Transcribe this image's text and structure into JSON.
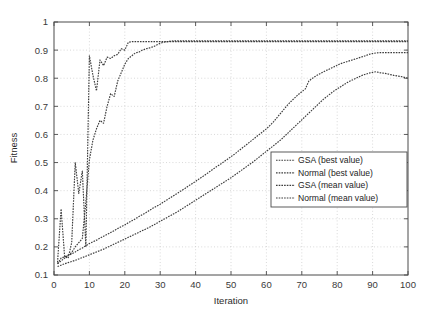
{
  "chart_data": {
    "type": "line",
    "title": "",
    "xlabel": "Iteration",
    "ylabel": "Fitness",
    "xlim": [
      0,
      100
    ],
    "ylim": [
      0.1,
      1
    ],
    "xticks": [
      0,
      10,
      20,
      30,
      40,
      50,
      60,
      70,
      80,
      90,
      100
    ],
    "xtick_labels": [
      "0",
      "10",
      "20",
      "30",
      "40",
      "50",
      "60",
      "70",
      "80",
      "90",
      "100"
    ],
    "yticks": [
      0.1,
      0.2,
      0.3,
      0.4,
      0.5,
      0.6,
      0.7,
      0.8,
      0.9,
      1
    ],
    "ytick_labels": [
      "0.1",
      "0.2",
      "0.3",
      "0.4",
      "0.5",
      "0.6",
      "0.7",
      "0.8",
      "0.9",
      "1"
    ],
    "grid": true,
    "grid_color": "#c8c8c8",
    "legend_position": "center-right",
    "line_color": "#3c3c3c",
    "x": [
      1,
      2,
      3,
      4,
      5,
      6,
      7,
      8,
      9,
      10,
      11,
      12,
      13,
      14,
      15,
      16,
      17,
      18,
      19,
      20,
      21,
      22,
      23,
      24,
      25,
      26,
      27,
      28,
      29,
      30,
      31,
      32,
      33,
      34,
      35,
      36,
      37,
      38,
      39,
      40,
      41,
      42,
      43,
      44,
      45,
      46,
      47,
      48,
      49,
      50,
      51,
      52,
      53,
      54,
      55,
      56,
      57,
      58,
      59,
      60,
      61,
      62,
      63,
      64,
      65,
      66,
      67,
      68,
      69,
      70,
      71,
      72,
      73,
      74,
      75,
      76,
      77,
      78,
      79,
      80,
      81,
      82,
      83,
      84,
      85,
      86,
      87,
      88,
      89,
      90,
      91,
      92,
      93,
      94,
      95,
      96,
      97,
      98,
      99,
      100
    ],
    "series": [
      {
        "name": "GSA (best value)",
        "style": "dotted",
        "values": [
          0.145,
          0.335,
          0.165,
          0.16,
          0.215,
          0.5,
          0.39,
          0.47,
          0.2,
          0.88,
          0.81,
          0.755,
          0.865,
          0.845,
          0.875,
          0.87,
          0.88,
          0.885,
          0.905,
          0.9,
          0.928,
          0.93,
          0.93,
          0.93,
          0.93,
          0.93,
          0.93,
          0.93,
          0.93,
          0.93,
          0.93,
          0.93,
          0.93,
          0.93,
          0.93,
          0.93,
          0.93,
          0.93,
          0.93,
          0.93,
          0.93,
          0.93,
          0.93,
          0.93,
          0.93,
          0.93,
          0.93,
          0.93,
          0.93,
          0.93,
          0.93,
          0.93,
          0.93,
          0.93,
          0.93,
          0.93,
          0.93,
          0.93,
          0.93,
          0.93,
          0.93,
          0.93,
          0.93,
          0.93,
          0.93,
          0.93,
          0.93,
          0.93,
          0.93,
          0.93,
          0.93,
          0.93,
          0.93,
          0.93,
          0.93,
          0.93,
          0.93,
          0.93,
          0.93,
          0.93,
          0.93,
          0.93,
          0.93,
          0.93,
          0.93,
          0.93,
          0.93,
          0.93,
          0.93,
          0.93,
          0.93,
          0.93,
          0.93,
          0.93,
          0.93,
          0.93,
          0.93,
          0.93,
          0.93,
          0.93
        ]
      },
      {
        "name": "Normal (best value)",
        "style": "dotted",
        "values": [
          0.14,
          0.15,
          0.16,
          0.17,
          0.18,
          0.2,
          0.215,
          0.23,
          0.36,
          0.51,
          0.58,
          0.62,
          0.65,
          0.64,
          0.7,
          0.745,
          0.735,
          0.79,
          0.82,
          0.85,
          0.87,
          0.88,
          0.89,
          0.893,
          0.9,
          0.905,
          0.908,
          0.912,
          0.918,
          0.924,
          0.928,
          0.93,
          0.932,
          0.933,
          0.933,
          0.933,
          0.933,
          0.933,
          0.933,
          0.933,
          0.933,
          0.933,
          0.933,
          0.933,
          0.933,
          0.933,
          0.933,
          0.933,
          0.933,
          0.933,
          0.933,
          0.933,
          0.933,
          0.933,
          0.933,
          0.933,
          0.933,
          0.933,
          0.933,
          0.933,
          0.933,
          0.933,
          0.933,
          0.933,
          0.933,
          0.933,
          0.933,
          0.933,
          0.933,
          0.933,
          0.933,
          0.933,
          0.933,
          0.933,
          0.933,
          0.933,
          0.933,
          0.933,
          0.933,
          0.933,
          0.933,
          0.933,
          0.933,
          0.933,
          0.933,
          0.933,
          0.933,
          0.933,
          0.933,
          0.933,
          0.933,
          0.933,
          0.933,
          0.933,
          0.933,
          0.933,
          0.933,
          0.933,
          0.933,
          0.933
        ]
      },
      {
        "name": "GSA (mean value)",
        "style": "dotted",
        "values": [
          0.14,
          0.16,
          0.165,
          0.17,
          0.175,
          0.182,
          0.19,
          0.196,
          0.204,
          0.212,
          0.218,
          0.224,
          0.231,
          0.238,
          0.244,
          0.251,
          0.258,
          0.265,
          0.272,
          0.278,
          0.286,
          0.293,
          0.3,
          0.308,
          0.315,
          0.322,
          0.33,
          0.338,
          0.345,
          0.352,
          0.36,
          0.368,
          0.376,
          0.384,
          0.392,
          0.4,
          0.408,
          0.417,
          0.425,
          0.433,
          0.442,
          0.45,
          0.459,
          0.468,
          0.477,
          0.486,
          0.494,
          0.503,
          0.512,
          0.521,
          0.53,
          0.54,
          0.55,
          0.56,
          0.57,
          0.58,
          0.59,
          0.6,
          0.61,
          0.62,
          0.632,
          0.645,
          0.66,
          0.675,
          0.69,
          0.705,
          0.718,
          0.73,
          0.742,
          0.752,
          0.762,
          0.79,
          0.8,
          0.808,
          0.815,
          0.822,
          0.828,
          0.834,
          0.84,
          0.846,
          0.852,
          0.856,
          0.86,
          0.864,
          0.868,
          0.872,
          0.876,
          0.88,
          0.885,
          0.888,
          0.89,
          0.891,
          0.891,
          0.891,
          0.891,
          0.891,
          0.891,
          0.891,
          0.891,
          0.891
        ]
      },
      {
        "name": "Normal (mean value)",
        "style": "dotted",
        "values": [
          0.13,
          0.135,
          0.14,
          0.144,
          0.148,
          0.152,
          0.157,
          0.162,
          0.167,
          0.172,
          0.177,
          0.182,
          0.187,
          0.192,
          0.198,
          0.204,
          0.21,
          0.216,
          0.222,
          0.228,
          0.234,
          0.24,
          0.246,
          0.252,
          0.258,
          0.264,
          0.27,
          0.277,
          0.284,
          0.291,
          0.298,
          0.305,
          0.312,
          0.319,
          0.326,
          0.334,
          0.342,
          0.35,
          0.358,
          0.366,
          0.374,
          0.382,
          0.39,
          0.398,
          0.406,
          0.414,
          0.422,
          0.43,
          0.438,
          0.446,
          0.455,
          0.464,
          0.473,
          0.482,
          0.491,
          0.5,
          0.51,
          0.52,
          0.53,
          0.54,
          0.55,
          0.56,
          0.57,
          0.58,
          0.592,
          0.604,
          0.616,
          0.628,
          0.64,
          0.652,
          0.664,
          0.676,
          0.688,
          0.7,
          0.712,
          0.724,
          0.734,
          0.744,
          0.754,
          0.762,
          0.77,
          0.778,
          0.786,
          0.792,
          0.798,
          0.804,
          0.81,
          0.814,
          0.818,
          0.821,
          0.823,
          0.82,
          0.818,
          0.816,
          0.813,
          0.81,
          0.808,
          0.806,
          0.803,
          0.8
        ]
      }
    ]
  },
  "legend": {
    "entries": [
      {
        "label": "GSA (best value)"
      },
      {
        "label": "Normal (best value)"
      },
      {
        "label": "GSA (mean value)"
      },
      {
        "label": "Normal (mean value)"
      }
    ]
  }
}
